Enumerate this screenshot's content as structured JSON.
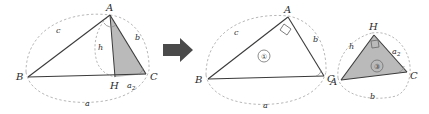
{
  "figure": {
    "colors": {
      "stroke": "#3a3a3a",
      "dashed_arc": "#9a9a9a",
      "shade_fill": "#b4b4b4",
      "arrow": "#4a4a4a",
      "background": "#ffffff"
    },
    "arrow_glyph": "➡"
  },
  "panels": [
    {
      "id": "panel-left",
      "name": "triangle-abc-with-altitude",
      "vertices": [
        {
          "key": "B",
          "label": "B"
        },
        {
          "key": "A",
          "label": "A"
        },
        {
          "key": "C",
          "label": "C"
        },
        {
          "key": "H",
          "label": "H"
        }
      ],
      "sides": [
        {
          "key": "c",
          "label": "c"
        },
        {
          "key": "b",
          "label": "b"
        },
        {
          "key": "h",
          "label": "h"
        },
        {
          "key": "a",
          "label": "a"
        },
        {
          "key": "a2",
          "label": "a",
          "subscript": "2"
        }
      ],
      "marks": [
        "right-angle-arc-at-A",
        "dashed-ellipse-arcs"
      ],
      "shaded_region": "triangle-A-H-C"
    },
    {
      "id": "panel-middle",
      "name": "triangle-abc-whole",
      "vertices": [
        {
          "key": "B",
          "label": "B"
        },
        {
          "key": "A",
          "label": "A"
        },
        {
          "key": "C",
          "label": "C"
        }
      ],
      "sides": [
        {
          "key": "c",
          "label": "c"
        },
        {
          "key": "b",
          "label": "b"
        },
        {
          "key": "a",
          "label": "a"
        }
      ],
      "region_number": "①",
      "marks": [
        "right-angle-square-at-A",
        "angle-arc-at-C",
        "dashed-ellipse-arcs"
      ],
      "shaded_region": "none"
    },
    {
      "id": "panel-right",
      "name": "triangle-ahc-similar",
      "vertices": [
        {
          "key": "A",
          "label": "A"
        },
        {
          "key": "H",
          "label": "H"
        },
        {
          "key": "C",
          "label": "C"
        }
      ],
      "sides": [
        {
          "key": "h",
          "label": "h"
        },
        {
          "key": "a2",
          "label": "a",
          "subscript": "2"
        },
        {
          "key": "b",
          "label": "b"
        }
      ],
      "region_number": "③",
      "marks": [
        "right-angle-square-at-H",
        "angle-arc-at-C",
        "dashed-ellipse-arcs"
      ],
      "shaded_region": "triangle-A-H-C"
    }
  ]
}
